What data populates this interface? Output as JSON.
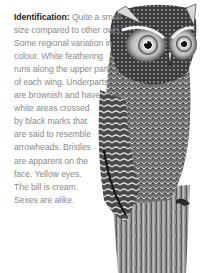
{
  "description": {
    "label": "Identification:",
    "lines": [
      " Quite a small",
      "size compared to other owls.",
      "Some regional variation in",
      "colour. White feathering",
      "runs along the upper part",
      "of each wing. Underparts",
      "are brownish and have",
      "white areas crossed",
      "by black marks that",
      "are said to resemble",
      "arrowheads. Bristles",
      "are apparent on the",
      "face. Yellow eyes.",
      "The bill is cream.",
      "Sexes are alike."
    ]
  },
  "illustration": {
    "subject": "owl-illustration",
    "style": "grayscale engraving",
    "colors": {
      "ink": "#1a1a1a",
      "mid": "#7a7a7a",
      "light": "#d8d8d8",
      "text_body": "#8a8a8a",
      "text_label": "#1e1e1e"
    }
  }
}
